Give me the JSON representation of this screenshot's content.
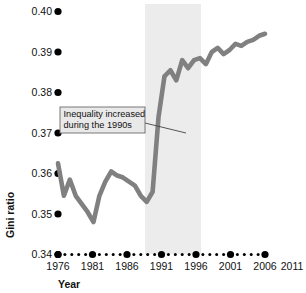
{
  "chart_data": {
    "type": "line",
    "title": "",
    "subtitle": "",
    "xlabel": "Year",
    "ylabel": "Gini ratio",
    "xlim": [
      1976,
      2011
    ],
    "ylim": [
      0.34,
      0.4
    ],
    "grid": false,
    "legend": "none",
    "line_color": "#808080",
    "shaded_band": {
      "label": "the 1990s",
      "x_start": 1991,
      "x_end": 2001,
      "color": "#ececec"
    },
    "y_ticks": [
      "0.34",
      "0.35",
      "0.36",
      "0.37",
      "0.38",
      "0.39",
      "0.40"
    ],
    "y_tick_values": [
      0.34,
      0.35,
      0.36,
      0.37,
      0.38,
      0.39,
      0.4
    ],
    "x_ticks": [
      "1976",
      "1981",
      "1986",
      "1991",
      "1996",
      "2001",
      "2006",
      "2011"
    ],
    "x_tick_values": [
      1976,
      1981,
      1986,
      1991,
      1996,
      2001,
      2006,
      2011
    ],
    "x_minor_values": [
      1977,
      1978,
      1979,
      1980,
      1982,
      1983,
      1984,
      1985,
      1987,
      1988,
      1989,
      1990,
      1992,
      1993,
      1994,
      1995,
      1997,
      1998,
      1999,
      2000,
      2002,
      2003,
      2004,
      2005,
      2007,
      2008,
      2009,
      2010
    ],
    "series": [
      {
        "name": "Gini ratio",
        "x": [
          1976,
          1977,
          1978,
          1979,
          1980,
          1981,
          1982,
          1983,
          1984,
          1985,
          1986,
          1987,
          1988,
          1989,
          1990,
          1991,
          1992,
          1993,
          1994,
          1995,
          1996,
          1997,
          1998,
          1999,
          2000,
          2001,
          2002,
          2003,
          2004,
          2005,
          2006,
          2007,
          2008,
          2009,
          2010,
          2011
        ],
        "values": [
          0.3625,
          0.3545,
          0.3585,
          0.3545,
          0.3525,
          0.3505,
          0.348,
          0.3545,
          0.358,
          0.3605,
          0.3595,
          0.359,
          0.358,
          0.357,
          0.3545,
          0.353,
          0.3555,
          0.374,
          0.384,
          0.3855,
          0.383,
          0.388,
          0.386,
          0.388,
          0.3885,
          0.387,
          0.39,
          0.391,
          0.3895,
          0.3905,
          0.392,
          0.3915,
          0.3925,
          0.393,
          0.394,
          0.3945
        ]
      }
    ],
    "annotations": [
      {
        "name": "inequality-callout",
        "line1": "Inequality increased",
        "line2": "during the 1990s",
        "points_to_x": 1995,
        "points_to_y": 0.3775
      }
    ]
  }
}
